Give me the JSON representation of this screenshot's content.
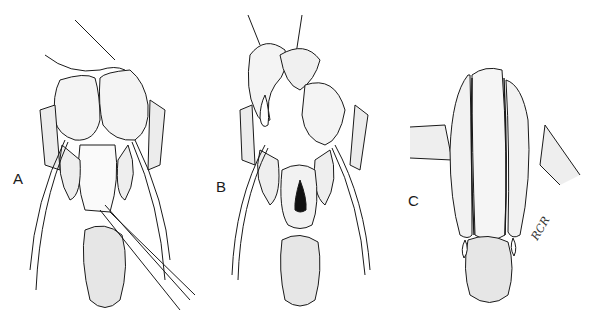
{
  "figure": {
    "panels": [
      {
        "id": "A",
        "label": "A",
        "label_pos": {
          "x": 13,
          "y": 170
        }
      },
      {
        "id": "B",
        "label": "B",
        "label_pos": {
          "x": 216,
          "y": 178
        }
      },
      {
        "id": "C",
        "label": "C",
        "label_pos": {
          "x": 408,
          "y": 192
        }
      }
    ],
    "signature": {
      "text": "RCR"
    },
    "colors": {
      "ink": "#1a1a1a",
      "paper": "#ffffff"
    }
  }
}
